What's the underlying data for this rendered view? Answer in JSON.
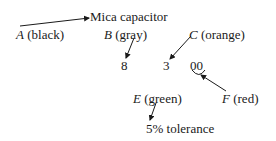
{
  "title": "Mica capacitor",
  "labels": {
    "A": {
      "letter": "A",
      "color": "(black)"
    },
    "B": {
      "letter": "B",
      "color": "(gray)"
    },
    "C": {
      "letter": "C",
      "color": "(orange)"
    },
    "E": {
      "letter": "E",
      "color": "(green)"
    },
    "F": {
      "letter": "F",
      "color": "(red)"
    }
  },
  "digits": {
    "d1": "8",
    "d2": "3",
    "multiplier": "00"
  },
  "tolerance": "5% tolerance"
}
